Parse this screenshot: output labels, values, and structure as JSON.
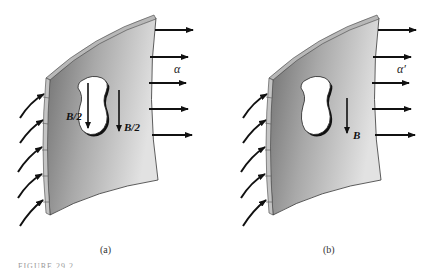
{
  "figure": {
    "panels": [
      {
        "id": "a",
        "caption": "(a)",
        "flux_label": "α",
        "hole_arrow_label": "B/2",
        "sheet_arrow_label": "B/2"
      },
      {
        "id": "b",
        "caption": "(b)",
        "flux_label": "α′",
        "sheet_arrow_label": "B"
      }
    ],
    "caption_text": "FIGURE 29.2 ..."
  },
  "colors": {
    "sheet_light": "#d8d8d8",
    "sheet_dark": "#7a7a7a",
    "edge": "#b0b0b0",
    "arrow": "#111111",
    "hole": "#ffffff"
  }
}
